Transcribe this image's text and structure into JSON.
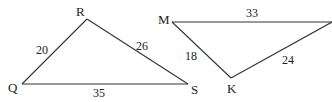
{
  "triangles": [
    {
      "name": "QRS",
      "vertices": {
        "Q": {
          "label": "Q",
          "x": 22,
          "y": 84
        },
        "R": {
          "label": "R",
          "x": 87,
          "y": 19
        },
        "S": {
          "label": "S",
          "x": 188,
          "y": 84
        }
      },
      "sides": {
        "QR": {
          "label": "20"
        },
        "RS": {
          "label": "26"
        },
        "QS": {
          "label": "35"
        }
      }
    },
    {
      "name": "MK?",
      "vertices": {
        "M": {
          "label": "M",
          "x": 172,
          "y": 22
        },
        "K": {
          "label": "K",
          "x": 231,
          "y": 78
        },
        "T": {
          "label": "",
          "x": 332,
          "y": 22
        }
      },
      "sides": {
        "MT": {
          "label": "33"
        },
        "MK": {
          "label": "18"
        },
        "KT": {
          "label": "24"
        }
      }
    }
  ],
  "colors": {
    "stroke": "#333333",
    "text": "#222222",
    "background": "#ffffff"
  }
}
